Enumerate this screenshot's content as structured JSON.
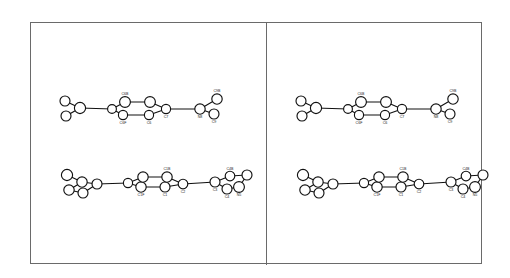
{
  "figure": {
    "kind": "stereo-pair-molecular-diagram",
    "panel_count": 2,
    "background_color": "#ffffff",
    "frame_color": "#6a6a6a",
    "atom_fill_color": "#ffffff",
    "atom_stroke_color": "#111111",
    "bond_color": "#111111",
    "label_color": "#222222"
  },
  "panels": [
    {
      "name": "left-view",
      "label": ""
    },
    {
      "name": "right-view",
      "label": ""
    }
  ],
  "molecules": {
    "upper": {
      "name": "upper-molecule",
      "labels": [
        "C6B",
        "C6F",
        "C6",
        "C7",
        "N8",
        "C9",
        "C9B"
      ],
      "atoms": [
        {
          "id": "a1",
          "label": "",
          "x": 16,
          "y": 78,
          "r": 5.0
        },
        {
          "id": "a2",
          "label": "",
          "x": 17,
          "y": 93,
          "r": 5.0
        },
        {
          "id": "a3",
          "label": "",
          "x": 31,
          "y": 85,
          "r": 5.6
        },
        {
          "id": "a4",
          "label": "",
          "x": 63,
          "y": 86,
          "r": 4.4
        },
        {
          "id": "a5",
          "label": "C6F",
          "x": 74,
          "y": 92,
          "r": 4.6
        },
        {
          "id": "a6",
          "label": "C6B",
          "x": 76,
          "y": 79,
          "r": 5.4
        },
        {
          "id": "a7",
          "label": "C6",
          "x": 100,
          "y": 92,
          "r": 4.6
        },
        {
          "id": "a8",
          "label": "",
          "x": 101,
          "y": 79,
          "r": 5.4
        },
        {
          "id": "a9",
          "label": "C7",
          "x": 117,
          "y": 86,
          "r": 4.6
        },
        {
          "id": "a10",
          "label": "N8",
          "x": 151,
          "y": 86,
          "r": 5.2
        },
        {
          "id": "a11",
          "label": "C9",
          "x": 165,
          "y": 91,
          "r": 5.0
        },
        {
          "id": "a12",
          "label": "C9B",
          "x": 168,
          "y": 76,
          "r": 5.2
        }
      ],
      "bonds": [
        {
          "from": "a1",
          "to": "a3",
          "order": 1
        },
        {
          "from": "a2",
          "to": "a3",
          "order": 1
        },
        {
          "from": "a3",
          "to": "a4",
          "order": 1
        },
        {
          "from": "a4",
          "to": "a5",
          "order": 1
        },
        {
          "from": "a4",
          "to": "a6",
          "order": 1
        },
        {
          "from": "a5",
          "to": "a7",
          "order": 1
        },
        {
          "from": "a6",
          "to": "a8",
          "order": 1
        },
        {
          "from": "a7",
          "to": "a9",
          "order": 1
        },
        {
          "from": "a8",
          "to": "a9",
          "order": 1
        },
        {
          "from": "a9",
          "to": "a10",
          "order": 1
        },
        {
          "from": "a10",
          "to": "a11",
          "order": 1
        },
        {
          "from": "a10",
          "to": "a12",
          "order": 1
        }
      ]
    },
    "lower": {
      "name": "lower-molecule",
      "labels": [
        "C1F",
        "C1",
        "C1B",
        "C2",
        "C3",
        "C4",
        "C4B",
        "N5"
      ],
      "atoms": [
        {
          "id": "b1",
          "label": "",
          "x": 36,
          "y": 152,
          "r": 5.6
        },
        {
          "id": "b2",
          "label": "",
          "x": 38,
          "y": 167,
          "r": 5.2
        },
        {
          "id": "b3",
          "label": "",
          "x": 51,
          "y": 159,
          "r": 5.2
        },
        {
          "id": "b4",
          "label": "",
          "x": 52,
          "y": 170,
          "r": 5.0
        },
        {
          "id": "b5",
          "label": "",
          "x": 66,
          "y": 161,
          "r": 5.0
        },
        {
          "id": "b6",
          "label": "",
          "x": 97,
          "y": 160,
          "r": 4.6
        },
        {
          "id": "b7",
          "label": "C1F",
          "x": 110,
          "y": 164,
          "r": 5.2
        },
        {
          "id": "b8",
          "label": "",
          "x": 112,
          "y": 154,
          "r": 5.2
        },
        {
          "id": "b9",
          "label": "C1",
          "x": 134,
          "y": 164,
          "r": 5.0
        },
        {
          "id": "b10",
          "label": "C1B",
          "x": 136,
          "y": 154,
          "r": 5.2
        },
        {
          "id": "b11",
          "label": "C2",
          "x": 152,
          "y": 161,
          "r": 4.8
        },
        {
          "id": "b12",
          "label": "C3",
          "x": 184,
          "y": 159,
          "r": 5.0
        },
        {
          "id": "b13",
          "label": "C4",
          "x": 196,
          "y": 166,
          "r": 5.0
        },
        {
          "id": "b14",
          "label": "C4B",
          "x": 199,
          "y": 153,
          "r": 4.8
        },
        {
          "id": "b15",
          "label": "N5",
          "x": 208,
          "y": 164,
          "r": 5.4
        },
        {
          "id": "b16",
          "label": "",
          "x": 216,
          "y": 152,
          "r": 5.0
        }
      ],
      "bonds": [
        {
          "from": "b1",
          "to": "b3",
          "order": 1
        },
        {
          "from": "b2",
          "to": "b3",
          "order": 1
        },
        {
          "from": "b2",
          "to": "b4",
          "order": 1
        },
        {
          "from": "b3",
          "to": "b5",
          "order": 1
        },
        {
          "from": "b4",
          "to": "b5",
          "order": 1
        },
        {
          "from": "b5",
          "to": "b6",
          "order": 1
        },
        {
          "from": "b6",
          "to": "b7",
          "order": 1
        },
        {
          "from": "b6",
          "to": "b8",
          "order": 1
        },
        {
          "from": "b7",
          "to": "b9",
          "order": 1
        },
        {
          "from": "b8",
          "to": "b10",
          "order": 1
        },
        {
          "from": "b9",
          "to": "b11",
          "order": 1
        },
        {
          "from": "b10",
          "to": "b11",
          "order": 1
        },
        {
          "from": "b11",
          "to": "b12",
          "order": 1
        },
        {
          "from": "b12",
          "to": "b13",
          "order": 1
        },
        {
          "from": "b12",
          "to": "b14",
          "order": 1
        },
        {
          "from": "b13",
          "to": "b15",
          "order": 1
        },
        {
          "from": "b14",
          "to": "b16",
          "order": 1
        },
        {
          "from": "b15",
          "to": "b16",
          "order": 1
        }
      ]
    }
  }
}
